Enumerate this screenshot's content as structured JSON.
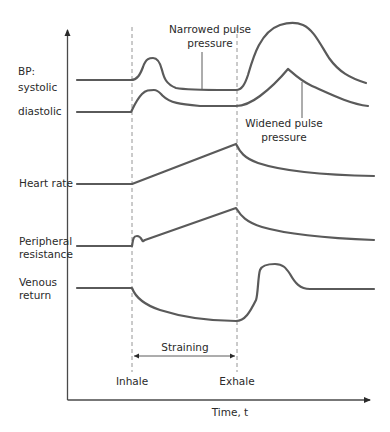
{
  "figure": {
    "type": "physiological-timing-diagram",
    "row_labels": {
      "bp_line1": "BP:",
      "bp_line2": "systolic",
      "diastolic": "diastolic",
      "heart_rate": "Heart rate",
      "peripheral_line1": "Peripheral",
      "peripheral_line2": "resistance",
      "venous_line1": "Venous",
      "venous_line2": "return"
    },
    "annotations": {
      "narrowed_line1": "Narrowed pulse",
      "narrowed_line2": "pressure",
      "widened_line1": "Widened pulse",
      "widened_line2": "pressure",
      "straining": "Straining"
    },
    "events": {
      "inhale": "Inhale",
      "exhale": "Exhale"
    },
    "x_axis_label": "Time, t",
    "colors": {
      "curve": "#5a5a5a",
      "axis": "#4a4a4a",
      "dashed": "#8a8a8a",
      "text": "#2a2a2a"
    }
  }
}
